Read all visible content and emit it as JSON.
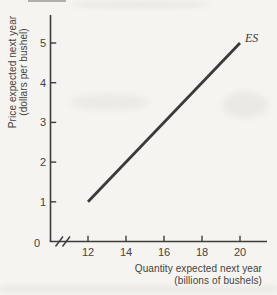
{
  "figure": {
    "bg_color": "#f6f4f0",
    "ink_color": "#3d3c3a",
    "y_axis": {
      "title_line1": "Price expected next year",
      "title_line2": "(dollars per bushel)",
      "origin_label": "0"
    },
    "x_axis": {
      "title_line1": "Quantity expected next year",
      "title_line2": "(billions of bushels)"
    }
  },
  "chart_data": {
    "type": "line",
    "title": "",
    "xlabel": "Quantity expected next year (billions of bushels)",
    "ylabel": "Price expected next year (dollars per bushel)",
    "x_ticks": [
      12,
      14,
      16,
      18,
      20
    ],
    "y_ticks": [
      1,
      2,
      3,
      4,
      5
    ],
    "xlim": [
      12,
      21.4
    ],
    "ylim": [
      0,
      5.7
    ],
    "x_axis_break": true,
    "grid": false,
    "legend_position": "inline-at-line-end",
    "series": [
      {
        "name": "ES",
        "points": [
          [
            12,
            1
          ],
          [
            20,
            5
          ]
        ]
      }
    ]
  }
}
